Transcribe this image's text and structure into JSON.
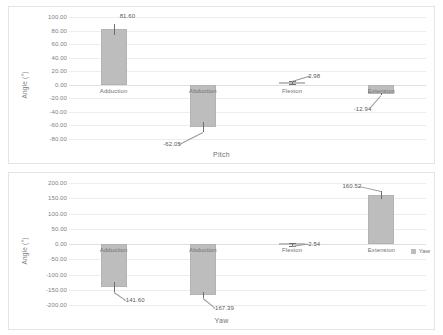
{
  "figure": {
    "background": "#ffffff",
    "bar_color": "#bdbdbd",
    "grid_color": "#ededed",
    "text_color": "#707070"
  },
  "charts": [
    {
      "id": "pitch",
      "type": "bar",
      "title": "",
      "xlabel": "Pitch",
      "ylabel": "Angle (°)",
      "categories": [
        "Adduction",
        "Abduction",
        "Flexion",
        "Extension"
      ],
      "values": [
        81.6,
        -62.05,
        2.98,
        -12.94
      ],
      "value_labels": [
        "81.60",
        "-62.05",
        "2.98",
        "-12.94"
      ],
      "errors": [
        7.5,
        7.0,
        2.2,
        1.5
      ],
      "ylim": [
        -80,
        100
      ],
      "yticks": [
        100,
        80,
        60,
        40,
        20,
        0,
        -20,
        -40,
        -60,
        -80
      ],
      "ytick_labels": [
        "100.00",
        "80.00",
        "60.00",
        "40.00",
        "20.00",
        "0.00",
        "-20.00",
        "-40.00",
        "-60.00",
        "-80.00"
      ],
      "grid": true,
      "legend": null
    },
    {
      "id": "yaw",
      "type": "bar",
      "title": "",
      "xlabel": "Yaw",
      "ylabel": "Angle (°)",
      "categories": [
        "Adduction",
        "Abduction",
        "Flexion",
        "Extension"
      ],
      "values": [
        -141.6,
        -167.39,
        -2.54,
        160.52
      ],
      "value_labels": [
        "-141.60",
        "-167.39",
        "-2.54",
        "160.52"
      ],
      "errors": [
        16.0,
        11.0,
        5.0,
        13.0
      ],
      "ylim": [
        -200,
        200
      ],
      "yticks": [
        200,
        150,
        100,
        50,
        0,
        -50,
        -100,
        -150,
        -200
      ],
      "ytick_labels": [
        "200.00",
        "150.00",
        "100.00",
        "50.00",
        "0.00",
        "-50.00",
        "-100.00",
        "-150.00",
        "-200.00"
      ],
      "grid": true,
      "legend": {
        "label": "Yaw",
        "position": "right"
      }
    }
  ],
  "chart_data": [
    {
      "type": "bar",
      "title": "Pitch",
      "categories": [
        "Adduction",
        "Abduction",
        "Flexion",
        "Extension"
      ],
      "values": [
        81.6,
        -62.05,
        2.98,
        -12.94
      ],
      "errors": [
        7.5,
        7.0,
        2.2,
        1.5
      ],
      "xlabel": "Pitch",
      "ylabel": "Angle (°)",
      "ylim": [
        -80,
        100
      ],
      "yticks": [
        100,
        80,
        60,
        40,
        20,
        0,
        -20,
        -40,
        -60,
        -80
      ],
      "grid": true,
      "legend": null
    },
    {
      "type": "bar",
      "title": "Yaw",
      "categories": [
        "Adduction",
        "Abduction",
        "Flexion",
        "Extension"
      ],
      "values": [
        -141.6,
        -167.39,
        -2.54,
        160.52
      ],
      "errors": [
        16.0,
        11.0,
        5.0,
        13.0
      ],
      "xlabel": "Yaw",
      "ylabel": "Angle (°)",
      "ylim": [
        -200,
        200
      ],
      "yticks": [
        200,
        150,
        100,
        50,
        0,
        -50,
        -100,
        -150,
        -200
      ],
      "grid": true,
      "legend": {
        "entries": [
          "Yaw"
        ],
        "position": "right"
      }
    }
  ]
}
